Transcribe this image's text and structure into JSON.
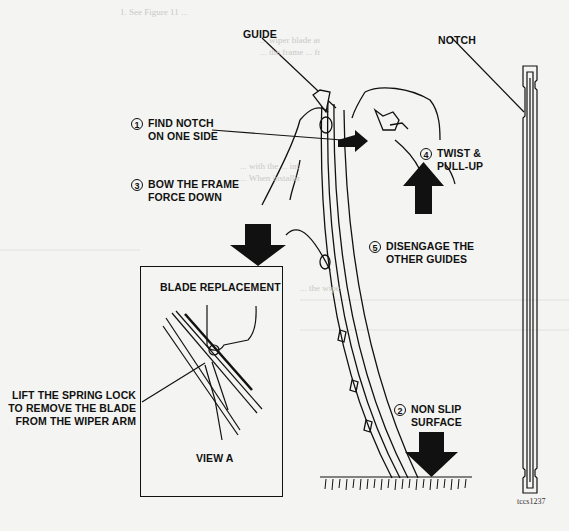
{
  "figure": {
    "id": "tccs1237",
    "background": "#f4f4f2",
    "ink": "#111111"
  },
  "labels": {
    "guide": "GUIDE",
    "notch": "NOTCH",
    "step1": {
      "num": "1",
      "line1": "FIND NOTCH",
      "line2": "ON ONE SIDE"
    },
    "step2": {
      "num": "2",
      "line1": "NON SLIP",
      "line2": "SURFACE"
    },
    "step3": {
      "num": "3",
      "line1": "BOW THE FRAME",
      "line2": "FORCE DOWN"
    },
    "step4": {
      "num": "4",
      "line1": "TWIST &",
      "line2": "PULL-UP"
    },
    "step5": {
      "num": "5",
      "line1": "DISENGAGE THE",
      "line2": "OTHER GUIDES"
    }
  },
  "inset": {
    "title": "BLADE REPLACEMENT",
    "caption": "VIEW A",
    "callout_line1": "LIFT THE SPRING LOCK",
    "callout_line2": "TO REMOVE THE BLADE",
    "callout_line3": "FROM THE WIPER ARM"
  },
  "bleed_through": {
    "heading": "1. See Figure 11 ...",
    "lines": [
      "... wiper blade assembly ... the arm ...",
      "... the frame ... from the blade ...",
      "... with the ... into the blade ...",
      "... When installing ... the frame ...",
      "... the wiper ... the guides ..."
    ]
  }
}
